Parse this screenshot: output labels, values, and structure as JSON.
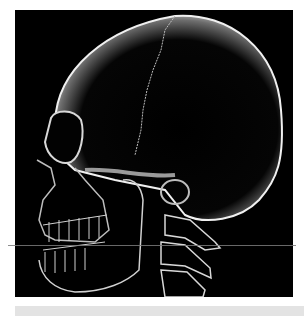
{
  "image": {
    "subject": "Lateral X-ray style render of a human skull and cervical spine",
    "alt": "Skull X-ray side view",
    "background_color": "#000000",
    "page_color": "#ffffff",
    "bar_color": "#e3e3e3",
    "line_color": "#7a7a7a"
  }
}
